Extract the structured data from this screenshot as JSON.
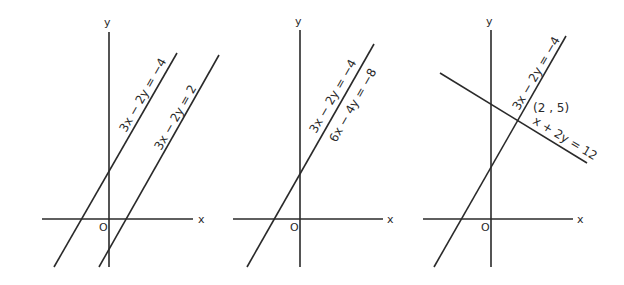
{
  "figure": {
    "panels": [
      {
        "title": "inconsistent system (parallel lines)",
        "axis_labels": {
          "x": "x",
          "y": "y",
          "origin": "O"
        },
        "equations": [
          "3x − 2y = −4",
          "3x − 2y = 2"
        ]
      },
      {
        "title": "dependent system (coincident lines)",
        "axis_labels": {
          "x": "x",
          "y": "y",
          "origin": "O"
        },
        "equations": [
          "3x − 2y = −4",
          "6x − 4y = −8"
        ]
      },
      {
        "title": "consistent system (intersecting lines)",
        "axis_labels": {
          "x": "x",
          "y": "y",
          "origin": "O"
        },
        "equations": [
          "3x − 2y = −4",
          "x + 2y = 12"
        ],
        "intersection_label": "(2 , 5)"
      }
    ]
  }
}
